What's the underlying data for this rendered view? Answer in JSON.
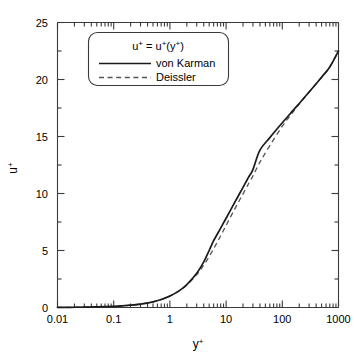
{
  "chart_data": {
    "type": "line",
    "title": "",
    "xlabel": "y+",
    "ylabel": "u+",
    "xscale": "log",
    "yscale": "linear",
    "xlim": [
      0.01,
      1000
    ],
    "ylim": [
      0,
      25
    ],
    "grid": false,
    "legend_position": "upper-left-inside",
    "legend_title": "u+ = u+(y+)",
    "xticks": [
      "0.01",
      "0.1",
      "1",
      "10",
      "100",
      "1000"
    ],
    "xtick_values": [
      0.01,
      0.1,
      1,
      10,
      100,
      1000
    ],
    "yticks": [
      "0",
      "5",
      "10",
      "15",
      "20",
      "25"
    ],
    "ytick_values": [
      0,
      5,
      10,
      15,
      20,
      25
    ],
    "yminor_step": 2.5,
    "series": [
      {
        "name": "von Karman",
        "style": "solid",
        "color": "#1a1a1a",
        "x": [
          0.01,
          0.02,
          0.05,
          0.1,
          0.2,
          0.3,
          0.5,
          0.7,
          1.0,
          1.5,
          2.0,
          3.0,
          4.0,
          5.0,
          6.0,
          7.0,
          8.0,
          9.0,
          10.0,
          12.0,
          14.0,
          16.0,
          18.0,
          20.0,
          24.0,
          26.0,
          30.0,
          40.0,
          60.0,
          100.0,
          150.0,
          200.0,
          300.0,
          500.0,
          700.0,
          1000.0
        ],
        "y": [
          0.01,
          0.02,
          0.05,
          0.1,
          0.2,
          0.3,
          0.5,
          0.7,
          1.0,
          1.5,
          2.0,
          3.0,
          4.0,
          5.0,
          5.86,
          6.45,
          6.96,
          7.42,
          7.83,
          8.54,
          9.15,
          9.67,
          10.13,
          10.54,
          11.25,
          11.56,
          12.1,
          13.8,
          14.9,
          16.2,
          17.2,
          17.9,
          18.9,
          20.2,
          21.1,
          22.5
        ]
      },
      {
        "name": "Deissler",
        "style": "dashed",
        "color": "#555555",
        "x": [
          0.01,
          0.02,
          0.05,
          0.1,
          0.2,
          0.3,
          0.5,
          0.7,
          1.0,
          1.5,
          2.0,
          3.0,
          4.0,
          5.0,
          6.0,
          7.0,
          8.0,
          9.0,
          10.0,
          12.0,
          14.0,
          16.0,
          18.0,
          20.0,
          24.0,
          26.0,
          30.0,
          40.0,
          60.0,
          100.0,
          150.0,
          200.0,
          300.0,
          500.0,
          700.0,
          1000.0
        ],
        "y": [
          0.01,
          0.02,
          0.05,
          0.1,
          0.2,
          0.3,
          0.5,
          0.7,
          1.0,
          1.49,
          1.97,
          2.88,
          3.72,
          4.47,
          5.15,
          5.75,
          6.29,
          6.77,
          7.2,
          7.95,
          8.57,
          9.1,
          9.56,
          9.97,
          10.68,
          10.99,
          11.54,
          12.75,
          14.2,
          15.9,
          17.05,
          17.85,
          18.9,
          20.2,
          21.1,
          22.5
        ]
      }
    ],
    "legend_entries": [
      {
        "label": "von Karman",
        "style": "solid"
      },
      {
        "label": "Deissler",
        "style": "dashed"
      }
    ],
    "annotations": []
  },
  "legend": {
    "title_base": "u",
    "title_sup1": "+",
    "title_eq": " = u",
    "title_sup2": "+",
    "title_open": "(y",
    "title_sup3": "+",
    "title_close": ")",
    "entry1": "von Karman",
    "entry2": "Deissler"
  },
  "axes": {
    "x_label_base": "y",
    "x_label_sup": "+",
    "y_label_base": "u",
    "y_label_sup": "+"
  }
}
